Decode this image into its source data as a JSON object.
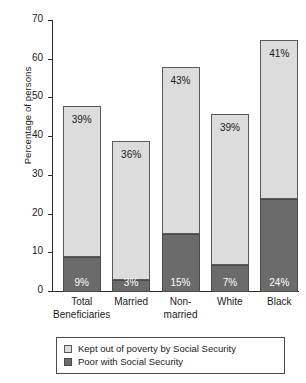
{
  "chart_data": {
    "type": "bar",
    "title": "",
    "subtitle": "",
    "xlabel": "",
    "ylabel": "Percentage of persons",
    "ylim": [
      0,
      70
    ],
    "yticks": [
      0,
      10,
      20,
      30,
      40,
      50,
      60,
      70
    ],
    "ytick_labels": [
      "0",
      "10",
      "20",
      "30",
      "40",
      "50",
      "60",
      "70"
    ],
    "grid": false,
    "stacked": true,
    "legend_position": "bottom",
    "categories": [
      "Total Beneficiaries",
      "Married",
      "Non-married",
      "White",
      "Black"
    ],
    "category_lines": [
      [
        "Total",
        "Beneficiaries"
      ],
      [
        "Married",
        ""
      ],
      [
        "Non-",
        "married"
      ],
      [
        "White",
        ""
      ],
      [
        "Black",
        ""
      ]
    ],
    "series": [
      {
        "name": "Poor with Social Security",
        "color": "#6b6b6b",
        "values": [
          9,
          3,
          15,
          7,
          24
        ],
        "labels": [
          "9%",
          "3%",
          "15%",
          "7%",
          "24%"
        ]
      },
      {
        "name": "Kept out of poverty by Social Security",
        "color": "#dcdcdc",
        "values": [
          39,
          36,
          43,
          39,
          41
        ],
        "labels": [
          "39%",
          "36%",
          "43%",
          "39%",
          "41%"
        ]
      }
    ],
    "totals": [
      48,
      39,
      58,
      46,
      65
    ]
  },
  "legend": {
    "items": [
      {
        "label": "Kept out of poverty by Social Security",
        "swatch": "light"
      },
      {
        "label": "Poor with Social Security",
        "swatch": "dark"
      }
    ]
  },
  "colors": {
    "light_gray": "#dcdcdc",
    "dark_gray": "#6b6b6b",
    "axis": "#2a2a2a",
    "background": "#ffffff"
  }
}
